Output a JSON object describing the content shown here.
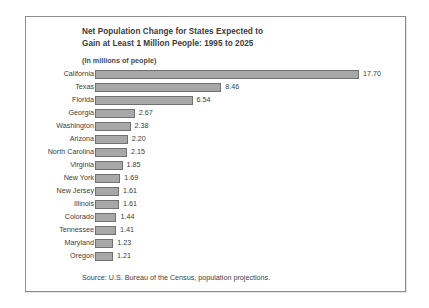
{
  "figure": {
    "title_line_1": "Net Population Change for States Expected to",
    "title_line_2": "Gain at Least 1 Million People:  1995 to 2025",
    "units_note": "(In millions of people)",
    "source_note": "Source:  U.S. Bureau of the Census, population projections.",
    "bar_fill_color": "#a8a8a8",
    "bar_edge_color": "#707070",
    "frame_color": "#8d8d8d",
    "background_color": "#ffffff"
  },
  "chart_data": {
    "type": "bar",
    "orientation": "horizontal",
    "title": "Net Population Change for States Expected to Gain at Least 1 Million People:  1995 to 2025",
    "subtitle": "(In millions of people)",
    "xlabel": "",
    "ylabel": "",
    "ylim": [
      0,
      17.7
    ],
    "grid": false,
    "legend": false,
    "source": "Source:  U.S. Bureau of the Census, population projections.",
    "categories": [
      "California",
      "Texas",
      "Florida",
      "Georgia",
      "Washington",
      "Arizona",
      "North Carolina",
      "Virginia",
      "New York",
      "New Jersey",
      "Illinois",
      "Colorado",
      "Tennessee",
      "Maryland",
      "Oregon"
    ],
    "values": [
      17.7,
      8.46,
      6.54,
      2.67,
      2.38,
      2.2,
      2.15,
      1.85,
      1.69,
      1.61,
      1.61,
      1.44,
      1.41,
      1.23,
      1.21
    ],
    "value_labels": [
      "17.70",
      "8.46",
      "6.54",
      "2.67",
      "2.38",
      "2.20",
      "2.15",
      "1.85",
      "1.69",
      "1.61",
      "1.61",
      "1.44",
      "1.41",
      "1.23",
      "1.21"
    ]
  }
}
